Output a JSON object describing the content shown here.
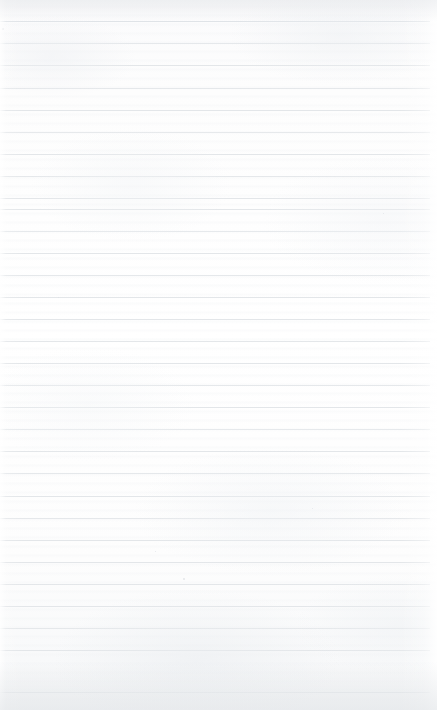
{
  "page": {
    "kind": "ruled-notebook-paper",
    "width": 437,
    "height": 710,
    "content_text": "",
    "has_visible_text": false
  },
  "colors": {
    "paper": "#fdfdfd",
    "paper_top_tint": "#f4f5f6",
    "paper_bottom_tint": "#f2f3f4",
    "rule_line": "#e3e6e9",
    "first_rule_line": "#dfe3e7",
    "speck": "#d9dde1"
  },
  "ruling": {
    "first_line_y": 21,
    "line_spacing": 22.2,
    "line_count": 31,
    "line_thickness": 1,
    "line_start_x": 0,
    "line_end_x": 430,
    "lines_y": [
      21,
      43,
      65,
      88,
      110,
      132,
      154,
      176,
      198,
      209,
      231,
      253,
      275,
      297,
      319,
      341,
      363,
      385,
      407,
      429,
      451,
      473,
      496,
      518,
      540,
      562,
      584,
      606,
      628,
      650,
      692
    ]
  },
  "specks": [
    {
      "x": 183,
      "y": 578,
      "size": 2
    },
    {
      "x": 2,
      "y": 28,
      "size": 2
    },
    {
      "x": 155,
      "y": 551,
      "size": 1
    },
    {
      "x": 383,
      "y": 213,
      "size": 1
    },
    {
      "x": 58,
      "y": 297,
      "size": 1
    },
    {
      "x": 312,
      "y": 508,
      "size": 1
    }
  ]
}
